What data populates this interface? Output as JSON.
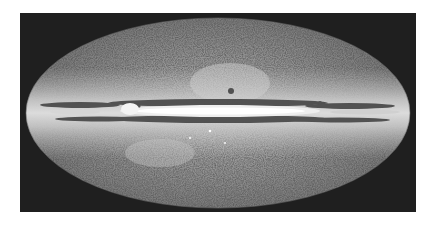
{
  "image": {
    "subject": "all-sky map of the Milky Way in elliptical projection",
    "colors": {
      "background": "#ffffff",
      "frame": "#1f1f1f",
      "sky_dark": "#5a5a5a",
      "sky_light": "#b8b8b8",
      "plane_halo": "#d9d9d9",
      "plane_core": "#ffffff",
      "dust_lanes": "#3a3a3a"
    }
  }
}
